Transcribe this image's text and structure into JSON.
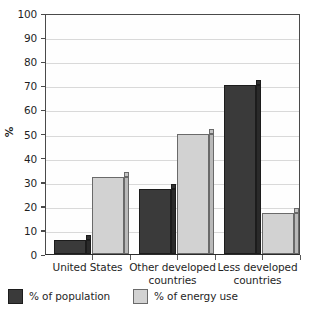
{
  "chart_data": {
    "type": "bar",
    "title": "",
    "subtitle": "",
    "xlabel": "",
    "ylabel": "%",
    "ylim": [
      0,
      100
    ],
    "ytick_step": 10,
    "yticks": [
      "100",
      "90",
      "80",
      "70",
      "60",
      "50",
      "40",
      "30",
      "20",
      "10",
      "0"
    ],
    "grid": true,
    "grid_axis": "y",
    "legend_position": "bottom",
    "categories": [
      "United States",
      "Other developed countries",
      "Less developed countries"
    ],
    "category_lines": [
      [
        "United States"
      ],
      [
        "Other developed",
        "countries"
      ],
      [
        "Less developed",
        "countries"
      ]
    ],
    "series": [
      {
        "name": "% of population",
        "color": "#3a3a3a",
        "values": [
          6,
          27,
          70
        ]
      },
      {
        "name": "% of energy use",
        "color": "#d2d2d2",
        "values": [
          32,
          50,
          17
        ]
      }
    ]
  },
  "legend": {
    "items": [
      {
        "label": "% of population",
        "swatch": "dark"
      },
      {
        "label": "% of energy use",
        "swatch": "light"
      }
    ]
  },
  "colors": {
    "population_bar": "#3a3a3a",
    "energy_bar": "#d2d2d2",
    "axis": "#4a4a4a",
    "gridline": "#d9d9d9",
    "background": "#ffffff"
  }
}
